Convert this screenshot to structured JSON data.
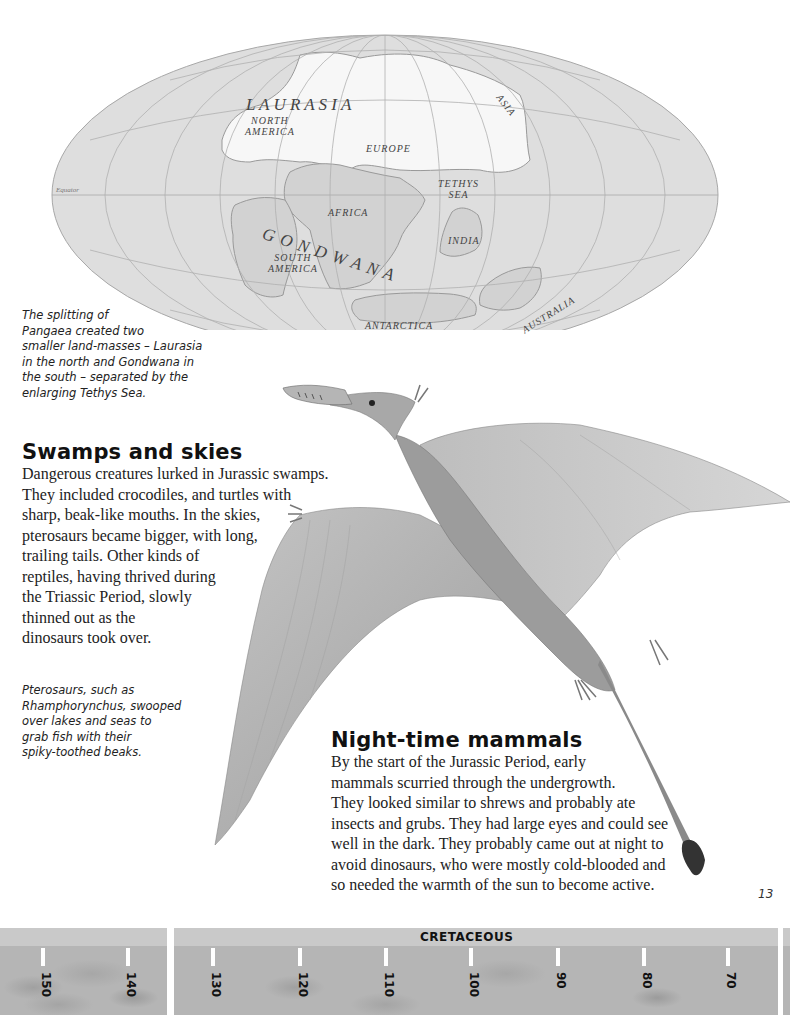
{
  "map": {
    "labels": {
      "laurasia": "L A U R A S I A",
      "north_america": "NORTH\nAMERICA",
      "asia": "ASIA",
      "europe": "EUROPE",
      "equator": "Equator",
      "tethys_sea": "TETHYS\nSEA",
      "africa": "AFRICA",
      "gondwana": "G O N D W A N A",
      "south_america": "SOUTH\nAMERICA",
      "india": "INDIA",
      "antarctica": "ANTARCTICA",
      "australia": "AUSTRALIA"
    },
    "caption": "The splitting of Pangaea created two smaller land-masses – Laurasia in the north and Gondwana in the south – separated by the enlarging Tethys Sea.",
    "caption_lines": [
      "The splitting of",
      "Pangaea created two",
      "smaller land-masses – Laurasia",
      "in the north and Gondwana in",
      "the south – separated by the",
      "enlarging Tethys Sea."
    ]
  },
  "section_swamps": {
    "heading": "Swamps and skies",
    "lines": [
      "Dangerous creatures lurked in Jurassic swamps.",
      "They included crocodiles, and turtles with",
      "sharp, beak-like mouths. In the skies,",
      "pterosaurs became bigger, with long,",
      "trailing tails. Other kinds of",
      "reptiles, having thrived during",
      "the Triassic Period, slowly",
      "thinned out as the",
      "dinosaurs took over."
    ]
  },
  "pterosaur_caption": {
    "lines": [
      "Pterosaurs, such as",
      "Rhamphorynchus, swooped",
      "over lakes and seas to",
      "grab fish with their",
      "spiky-toothed beaks."
    ]
  },
  "section_mammals": {
    "heading": "Night-time mammals",
    "lines": [
      "By the start of the Jurassic Period, early",
      "mammals scurried through the undergrowth.",
      "They looked similar to shrews and probably ate",
      "insects and grubs. They had large eyes and could see",
      "well in the dark. They probably came out at night to",
      "avoid dinosaurs, who were mostly cold-blooded and",
      "so needed the warmth of the sun to become active."
    ]
  },
  "page_number": "13",
  "timeline": {
    "era_label": "CRETACEOUS",
    "ticks": [
      {
        "label": "150",
        "x": 43
      },
      {
        "label": "140",
        "x": 128
      },
      {
        "label": "130",
        "x": 213
      },
      {
        "label": "120",
        "x": 300
      },
      {
        "label": "110",
        "x": 386
      },
      {
        "label": "100",
        "x": 470
      },
      {
        "label": "90",
        "x": 557
      },
      {
        "label": "80",
        "x": 643
      },
      {
        "label": "70",
        "x": 727
      }
    ]
  }
}
